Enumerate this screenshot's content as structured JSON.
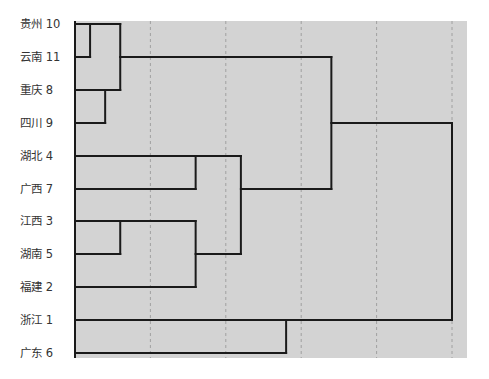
{
  "chart_data": {
    "type": "dendrogram",
    "title": "",
    "xlabel": "",
    "ylabel": "",
    "xlim": [
      0,
      25
    ],
    "x_grid_ticks": [
      5,
      10,
      15,
      20,
      25
    ],
    "grid": true,
    "legend": null,
    "colors": {
      "plot_background": "#d3d3d3",
      "grid": "#a0a0a0",
      "lines": "#1a1a1a",
      "text": "#333333"
    },
    "leaves": [
      {
        "name": "贵州",
        "id": 10,
        "label": "贵州  10"
      },
      {
        "name": "云南",
        "id": 11,
        "label": "云南 11"
      },
      {
        "name": "重庆",
        "id": 8,
        "label": "重庆 8"
      },
      {
        "name": "四川",
        "id": 9,
        "label": "四川 9"
      },
      {
        "name": "湖北",
        "id": 4,
        "label": "湖北 4"
      },
      {
        "name": "广西",
        "id": 7,
        "label": "广西 7"
      },
      {
        "name": "江西",
        "id": 3,
        "label": "江西 3"
      },
      {
        "name": "湖南",
        "id": 5,
        "label": "湖南 5"
      },
      {
        "name": "福建",
        "id": 2,
        "label": "福建 2"
      },
      {
        "name": "浙江",
        "id": 1,
        "label": "浙江 1"
      },
      {
        "name": "广东",
        "id": 6,
        "label": "广东 6"
      }
    ],
    "merges": [
      {
        "id": "c1",
        "children": [
          "贵州",
          "云南"
        ],
        "distance": 1
      },
      {
        "id": "c2",
        "children": [
          "重庆",
          "四川"
        ],
        "distance": 2
      },
      {
        "id": "c3",
        "children": [
          "c1",
          "c2"
        ],
        "distance": 3
      },
      {
        "id": "c4",
        "children": [
          "江西",
          "湖南"
        ],
        "distance": 3
      },
      {
        "id": "c5",
        "children": [
          "湖北",
          "广西"
        ],
        "distance": 8
      },
      {
        "id": "c6",
        "children": [
          "c4",
          "福建"
        ],
        "distance": 8
      },
      {
        "id": "c7",
        "children": [
          "c5",
          "c6"
        ],
        "distance": 11
      },
      {
        "id": "c8",
        "children": [
          "浙江",
          "广东"
        ],
        "distance": 14
      },
      {
        "id": "c9",
        "children": [
          "c3",
          "c7"
        ],
        "distance": 17
      },
      {
        "id": "c10",
        "children": [
          "c9",
          "c8"
        ],
        "distance": 25
      }
    ]
  }
}
